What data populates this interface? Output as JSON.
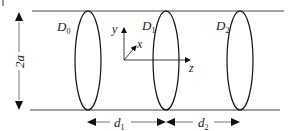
{
  "diagram": {
    "type": "waveguide-discs",
    "labels": {
      "height": "2a",
      "disc0": "D",
      "disc0_sub": "0",
      "disc1": "D",
      "disc1_sub": "1",
      "disc2": "D",
      "disc2_sub": "2",
      "axis_y": "y",
      "axis_x": "x",
      "axis_z": "z",
      "dist1": "d",
      "dist1_sub": "1",
      "dist2": "d",
      "dist2_sub": "2"
    },
    "colors": {
      "line": "#222222",
      "guide": "#444444",
      "background": "#ffffff"
    }
  }
}
